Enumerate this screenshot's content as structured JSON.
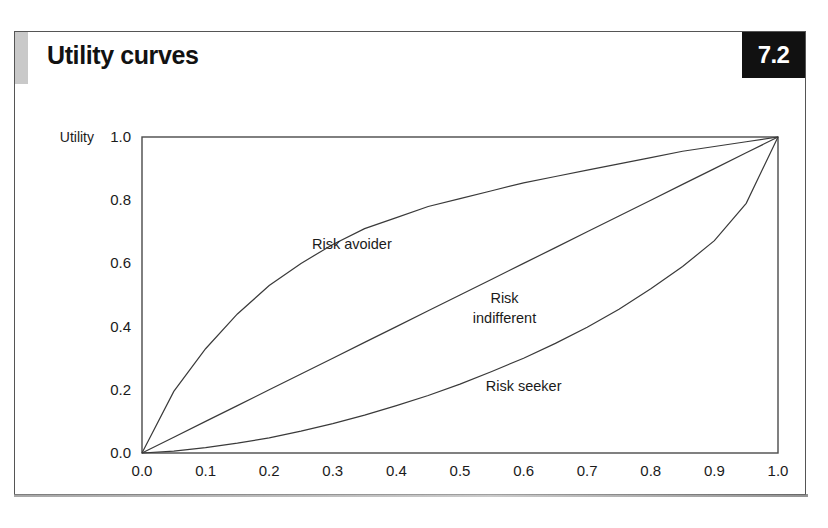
{
  "header": {
    "title": "Utility curves",
    "figure_number": "7.2",
    "badge_bg_color": "#111111",
    "accent_bar_color": "#c9c9c9"
  },
  "chart_data": {
    "type": "line",
    "title": "Utility curves",
    "xlabel": "Money values",
    "ylabel": "Utility",
    "xlim": [
      0.0,
      1.0
    ],
    "ylim": [
      0.0,
      1.0
    ],
    "grid": false,
    "legend": "inline-annotations",
    "x_tick_labels": [
      "0.0",
      "0.1",
      "0.2",
      "0.3",
      "0.4",
      "0.5",
      "0.6",
      "0.7",
      "0.8",
      "0.9",
      "1.0"
    ],
    "x_ticks": [
      0.0,
      0.1,
      0.2,
      0.3,
      0.4,
      0.5,
      0.6,
      0.7,
      0.8,
      0.9,
      1.0
    ],
    "y_tick_labels": [
      "0.0",
      "0.2",
      "0.4",
      "0.6",
      "0.8",
      "1.0"
    ],
    "y_ticks": [
      0.0,
      0.2,
      0.4,
      0.6,
      0.8,
      1.0
    ],
    "x": [
      0.0,
      0.05,
      0.1,
      0.15,
      0.2,
      0.25,
      0.3,
      0.35,
      0.4,
      0.45,
      0.5,
      0.55,
      0.6,
      0.65,
      0.7,
      0.75,
      0.8,
      0.85,
      0.9,
      0.95,
      1.0
    ],
    "series": [
      {
        "name": "Risk avoider",
        "shape": "concave",
        "values": [
          0.0,
          0.195,
          0.33,
          0.44,
          0.53,
          0.6,
          0.66,
          0.71,
          0.745,
          0.78,
          0.805,
          0.83,
          0.855,
          0.875,
          0.895,
          0.915,
          0.935,
          0.955,
          0.97,
          0.985,
          1.0
        ],
        "label_x": 0.33,
        "label_y": 0.645
      },
      {
        "name": "Risk indifferent",
        "shape": "linear",
        "values": [
          0.0,
          0.05,
          0.1,
          0.15,
          0.2,
          0.25,
          0.3,
          0.35,
          0.4,
          0.45,
          0.5,
          0.55,
          0.6,
          0.65,
          0.7,
          0.75,
          0.8,
          0.85,
          0.9,
          0.95,
          1.0
        ],
        "label_line_1": "Risk",
        "label_line_2": "indifferent",
        "label_x": 0.57,
        "label_y": 0.475
      },
      {
        "name": "Risk seeker",
        "shape": "convex",
        "values": [
          0.0,
          0.006,
          0.017,
          0.031,
          0.048,
          0.069,
          0.093,
          0.12,
          0.15,
          0.182,
          0.218,
          0.258,
          0.3,
          0.347,
          0.398,
          0.455,
          0.52,
          0.59,
          0.672,
          0.79,
          1.0
        ],
        "label_x": 0.6,
        "label_y": 0.196
      }
    ]
  }
}
